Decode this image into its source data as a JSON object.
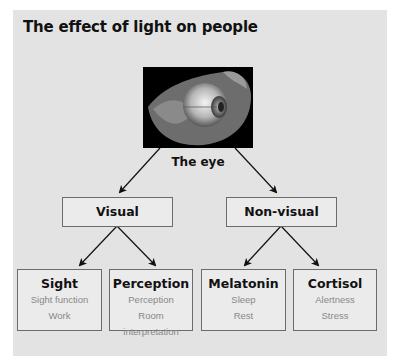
{
  "title": "The effect of light on people",
  "root": {
    "label": "The eye",
    "image": "eye-anatomy-photo"
  },
  "branches": [
    {
      "label": "Visual",
      "children": [
        {
          "label": "Sight",
          "items": [
            "Sight function",
            "Work"
          ]
        },
        {
          "label": "Perception",
          "items": [
            "Perception",
            "Room interpretation"
          ]
        }
      ]
    },
    {
      "label": "Non-visual",
      "children": [
        {
          "label": "Melatonin",
          "items": [
            "Sleep",
            "Rest"
          ]
        },
        {
          "label": "Cortisol",
          "items": [
            "Alertness",
            "Stress"
          ]
        }
      ]
    }
  ],
  "colors": {
    "panel": "#e3e3e3",
    "box_fill": "#ebebeb",
    "box_border": "#6b6b6b",
    "text": "#111111",
    "subtext": "#888888"
  }
}
